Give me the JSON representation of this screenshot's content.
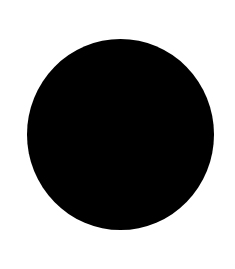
{
  "canvas": {
    "background": "#ffffff"
  },
  "shape": {
    "type": "circle",
    "fill": "#000000"
  }
}
